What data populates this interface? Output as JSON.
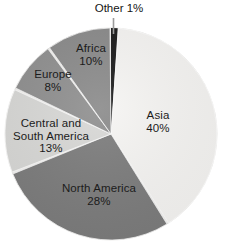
{
  "chart_data": {
    "type": "pie",
    "title": "",
    "subtitle": "",
    "xlabel": "",
    "ylabel": "",
    "grid": false,
    "legend_position": "none",
    "labels_inside_slices": true,
    "units": "percent",
    "total": 100,
    "start_angle_deg": 0,
    "direction": "clockwise",
    "categories": [
      "Other",
      "Asia",
      "North America",
      "Central and South America",
      "Europe",
      "Africa"
    ],
    "values": [
      1,
      40,
      28,
      13,
      8,
      10
    ],
    "slices": [
      {
        "name": "Other",
        "value": 1,
        "value_label": "1%",
        "label_lines": [
          "Other 1%"
        ],
        "color": "#1a1a1a",
        "label_placement": "callout-outside",
        "has_leader_line": true
      },
      {
        "name": "Asia",
        "value": 40,
        "value_label": "40%",
        "label_lines": [
          "Asia",
          "40%"
        ],
        "color": "#f6f5f3",
        "label_placement": "inside"
      },
      {
        "name": "North America",
        "value": 28,
        "value_label": "28%",
        "label_lines": [
          "North America",
          "28%"
        ],
        "color": "#7c7c7c",
        "label_placement": "inside"
      },
      {
        "name": "Central and South America",
        "value": 13,
        "value_label": "13%",
        "label_lines": [
          "Central and",
          "South America",
          "13%"
        ],
        "color": "#d8d8d6",
        "label_placement": "inside"
      },
      {
        "name": "Europe",
        "value": 8,
        "value_label": "8%",
        "label_lines": [
          "Europe",
          "8%"
        ],
        "color": "#8f8f8f",
        "label_placement": "inside"
      },
      {
        "name": "Africa",
        "value": 10,
        "value_label": "10%",
        "label_lines": [
          "Africa",
          "10%"
        ],
        "color": "#8a8a8a",
        "label_placement": "inside"
      }
    ],
    "geometry": {
      "center_x": 111,
      "center_y": 134,
      "radius": 106,
      "slice_gap_deg": 1.1
    },
    "style": {
      "background": "#ffffff",
      "slice_separator_color": "#ffffff",
      "label_text_color": "#1b1b1b",
      "leader_line_color": "#9b9b9b"
    }
  },
  "labels": {
    "other": {
      "line1": "Other 1%"
    },
    "asia": {
      "name": "Asia",
      "value": "40%"
    },
    "north": {
      "name": "North America",
      "value": "28%"
    },
    "central": {
      "line1": "Central and",
      "line2": "South America",
      "value": "13%"
    },
    "europe": {
      "name": "Europe",
      "value": "8%"
    },
    "africa": {
      "name": "Africa",
      "value": "10%"
    }
  }
}
